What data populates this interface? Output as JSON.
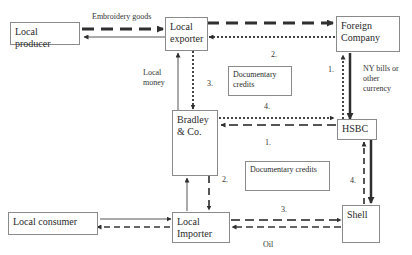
{
  "nodes": {
    "local_producer": "Local producer",
    "local_exporter": "Local exporter",
    "foreign_company": "Foreign Company",
    "bradley": "Bradley & Co.",
    "hsbc": "HSBC",
    "local_consumer": "Local consumer",
    "local_importer": "Local Importer",
    "shell": "Shell"
  },
  "notes": {
    "doc_credits_top": "Documentary credits",
    "doc_credits_bottom": "Documentary credits"
  },
  "labels": {
    "embroidery_goods": "Embroidery goods",
    "local_money": "Local money",
    "ny_bills": "NY bills or other currency",
    "oil": "Oil",
    "step_2_top": "2.",
    "step_3_left": "3.",
    "step_4_top": "4.",
    "step_1_right": "1.",
    "step_1_mid": "1.",
    "step_2_mid": "2.",
    "step_4_right": "4.",
    "step_3_bottom": "3."
  },
  "colors": {
    "line": "#3a3a3a",
    "border": "#8a8a8a"
  }
}
